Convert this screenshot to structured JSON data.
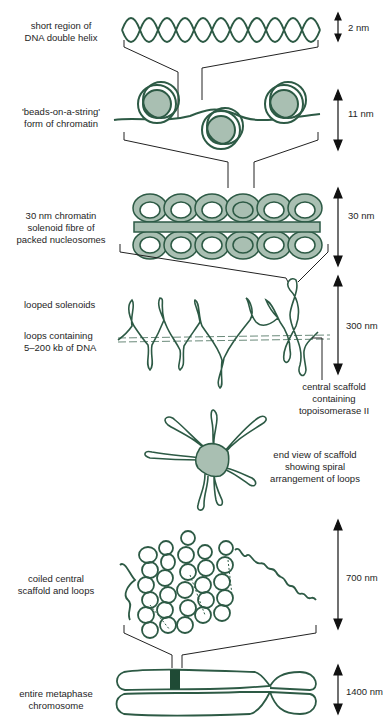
{
  "colors": {
    "strand": "#2d5a45",
    "fill": "#a9bfb2",
    "dark": "#1f4a35",
    "line": "#222222"
  },
  "stages": [
    {
      "id": "dna",
      "label_lines": [
        "short region of",
        "DNA double helix"
      ],
      "size": "2 nm"
    },
    {
      "id": "beads",
      "label_lines": [
        "'beads-on-a-string'",
        "form of chromatin"
      ],
      "size": "11 nm"
    },
    {
      "id": "solenoid",
      "label_lines": [
        "30 nm chromatin",
        "solenoid fibre of",
        "packed nucleosomes"
      ],
      "size": "30 nm"
    },
    {
      "id": "looped",
      "label_lines": [
        "looped solenoids"
      ],
      "size": "300 nm"
    },
    {
      "id": "loops",
      "label_lines": [
        "loops containing",
        "5–200 kb of DNA"
      ]
    },
    {
      "id": "scaffold",
      "label_lines": [
        "central scaffold",
        "containing",
        "topoisomerase II"
      ]
    },
    {
      "id": "endview",
      "label_lines": [
        "end view of scaffold",
        "showing spiral",
        "arrangement of loops"
      ]
    },
    {
      "id": "coiled",
      "label_lines": [
        "coiled central",
        "scaffold and loops"
      ],
      "size": "700 nm"
    },
    {
      "id": "chromosome",
      "label_lines": [
        "entire metaphase",
        "chromosome"
      ],
      "size": "1400 nm"
    }
  ]
}
